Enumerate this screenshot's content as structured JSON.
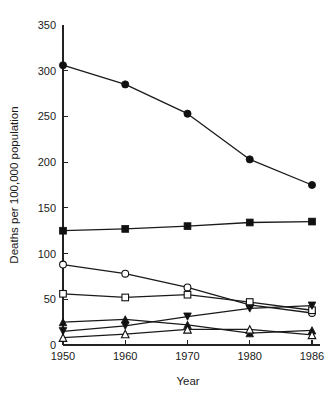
{
  "chart_data": {
    "type": "line",
    "title": "",
    "subtitle": "",
    "xlabel": "Year",
    "ylabel": "Deaths per 100,000 population",
    "categories": [
      "1950",
      "1960",
      "1970",
      "1980",
      "1986"
    ],
    "x": [
      1950,
      1960,
      1970,
      1980,
      1986
    ],
    "xlim": [
      1950,
      1986
    ],
    "ylim": [
      0,
      350
    ],
    "yticks": [
      0,
      50,
      100,
      150,
      200,
      250,
      300,
      350
    ],
    "ytick_labels": [
      "0",
      "50",
      "100",
      "150",
      "200",
      "250",
      "300",
      "350"
    ],
    "xtick_labels": [
      "1950",
      "1960",
      "1970",
      "1980",
      "1986"
    ],
    "grid": false,
    "legend": "none",
    "legend_position": "none",
    "axis_color": "#222222",
    "line_color": "#1a1a1a",
    "series": [
      {
        "name": "filled-circle-series",
        "marker": "filled-circle",
        "values": [
          306,
          285,
          253,
          203,
          175
        ]
      },
      {
        "name": "filled-square-series",
        "marker": "filled-square",
        "values": [
          125,
          127,
          130,
          134,
          135
        ]
      },
      {
        "name": "open-circle-series",
        "marker": "open-circle",
        "values": [
          88,
          78,
          63,
          44,
          35
        ]
      },
      {
        "name": "open-square-series",
        "marker": "open-square",
        "values": [
          56,
          52,
          55,
          47,
          38
        ]
      },
      {
        "name": "filled-triangle-up-series",
        "marker": "filled-triangle-up",
        "values": [
          25,
          28,
          22,
          13,
          16
        ]
      },
      {
        "name": "filled-triangle-down-series",
        "marker": "filled-triangle-down",
        "values": [
          15,
          21,
          31,
          40,
          43
        ]
      },
      {
        "name": "open-triangle-up-series",
        "marker": "open-triangle-up",
        "values": [
          8,
          12,
          17,
          17,
          11
        ]
      }
    ]
  },
  "layout": {
    "plot_left": 63,
    "plot_right": 312,
    "plot_top": 25,
    "plot_bottom": 345,
    "xaxis_overrun": 8
  }
}
